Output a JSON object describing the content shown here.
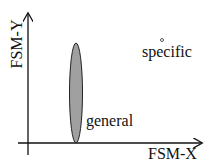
{
  "diagram": {
    "x_axis_label": "FSM-X",
    "y_axis_label": "FSM-Y",
    "regions": [
      {
        "label": "general",
        "shape": "ellipse",
        "fill": "#a0a0a0"
      },
      {
        "label": "specific",
        "shape": "point"
      }
    ]
  }
}
